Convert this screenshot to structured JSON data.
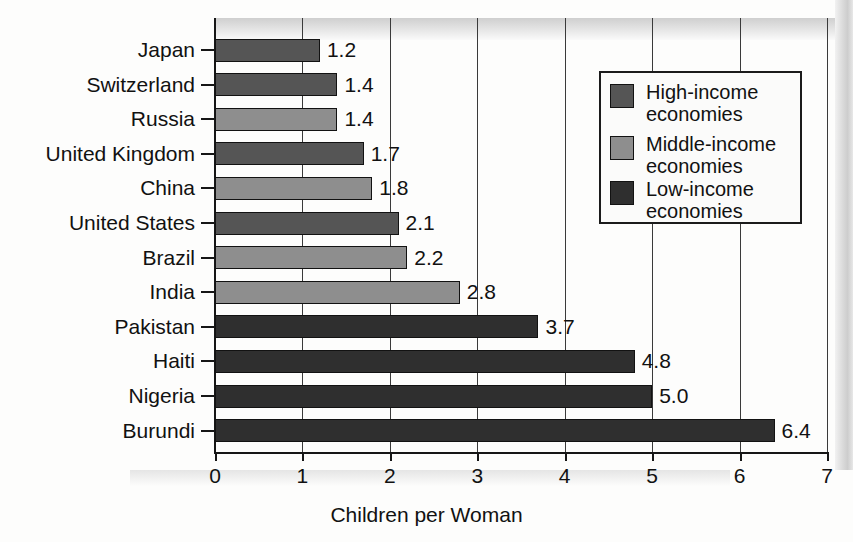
{
  "chart_data": {
    "type": "bar",
    "orientation": "horizontal",
    "title": "",
    "xlabel": "Children per Woman",
    "ylabel": "",
    "xlim": [
      0,
      7
    ],
    "xticks": [
      "0",
      "1",
      "2",
      "3",
      "4",
      "5",
      "6",
      "7"
    ],
    "grid": "vertical",
    "legend_position": "upper right",
    "categories": [
      "Japan",
      "Switzerland",
      "Russia",
      "United Kingdom",
      "China",
      "United States",
      "Brazil",
      "India",
      "Pakistan",
      "Haiti",
      "Nigeria",
      "Burundi"
    ],
    "values": [
      1.2,
      1.4,
      1.4,
      1.7,
      1.8,
      2.1,
      2.2,
      2.8,
      3.7,
      4.8,
      5.0,
      6.4
    ],
    "value_labels": [
      "1.2",
      "1.4",
      "1.4",
      "1.7",
      "1.8",
      "2.1",
      "2.2",
      "2.8",
      "3.7",
      "4.8",
      "5.0",
      "6.4"
    ],
    "groups": [
      "high",
      "high",
      "middle",
      "high",
      "middle",
      "high",
      "middle",
      "middle",
      "low",
      "low",
      "low",
      "low"
    ],
    "series": [
      {
        "name": "High-income economies",
        "key": "high",
        "color": "#555555",
        "points": [
          {
            "category": "Japan",
            "value": 1.2
          },
          {
            "category": "Switzerland",
            "value": 1.4
          },
          {
            "category": "United Kingdom",
            "value": 1.7
          },
          {
            "category": "United States",
            "value": 2.1
          }
        ]
      },
      {
        "name": "Middle-income economies",
        "key": "middle",
        "color": "#8e8e8e",
        "points": [
          {
            "category": "Russia",
            "value": 1.4
          },
          {
            "category": "China",
            "value": 1.8
          },
          {
            "category": "Brazil",
            "value": 2.2
          },
          {
            "category": "India",
            "value": 2.8
          }
        ]
      },
      {
        "name": "Low-income economies",
        "key": "low",
        "color": "#2f2f2f",
        "points": [
          {
            "category": "Pakistan",
            "value": 3.7
          },
          {
            "category": "Haiti",
            "value": 4.8
          },
          {
            "category": "Nigeria",
            "value": 5.0
          },
          {
            "category": "Burundi",
            "value": 6.4
          }
        ]
      }
    ]
  },
  "legend": {
    "items": [
      {
        "label": "High-income\neconomies",
        "key": "high"
      },
      {
        "label": "Middle-income\neconomies",
        "key": "middle"
      },
      {
        "label": "Low-income\neconomies",
        "key": "low"
      }
    ]
  },
  "axis": {
    "x_title": "Children per Woman"
  }
}
